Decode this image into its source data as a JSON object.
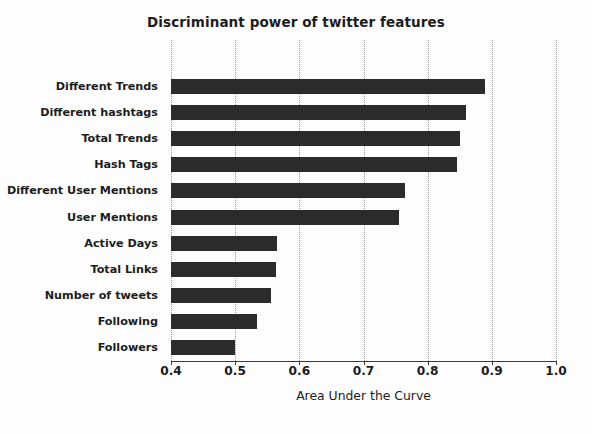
{
  "chart_data": {
    "type": "bar",
    "orientation": "horizontal",
    "title": "Discriminant power of twitter features",
    "xlabel": "Area Under the Curve",
    "ylabel": "",
    "xlim": [
      0.4,
      1.0
    ],
    "xticks": [
      "0.4",
      "0.5",
      "0.6",
      "0.7",
      "0.8",
      "0.9",
      "1.0"
    ],
    "xtick_values": [
      0.4,
      0.5,
      0.6,
      0.7,
      0.8,
      0.9,
      1.0
    ],
    "grid": "vertical-dotted",
    "legend": "none",
    "bar_color": "#2b2b2b",
    "categories": [
      "Different Trends",
      "Different hashtags",
      "Total Trends",
      "Hash Tags",
      "Different User Mentions",
      "User Mentions",
      "Active Days",
      "Total Links",
      "Number of tweets",
      "Following",
      "Followers"
    ],
    "values": [
      0.89,
      0.86,
      0.85,
      0.845,
      0.765,
      0.755,
      0.565,
      0.563,
      0.556,
      0.534,
      0.5
    ]
  }
}
